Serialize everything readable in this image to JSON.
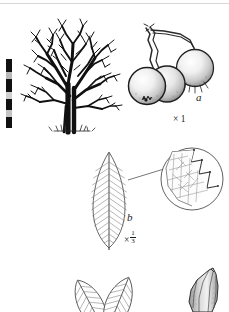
{
  "plate": {
    "kind": "botanical-illustration-plate",
    "background_color": "#ffffff",
    "ink_color": "#1a1a1a",
    "width": 229,
    "height": 312
  },
  "labels": {
    "fruit_letter": "a",
    "fruit_magnification": "× 1",
    "leaf_letter": "b",
    "leaf_magnification_prefix": "×",
    "leaf_magnification_numerator": "1",
    "leaf_magnification_denominator": "3"
  },
  "figures": {
    "habit": {
      "name": "tree-habit",
      "description": "Bare deciduous tree in winter silhouette with broad spreading crown and short double trunk",
      "ink_color": "#101010"
    },
    "fruit": {
      "name": "fruit-cluster",
      "description": "Three globose stippled fruits on slender stalks with persistent calyx lobes at apex",
      "count": 3,
      "ink_color": "#1a1a1a"
    },
    "leaf": {
      "name": "leaf-blade",
      "description": "Narrow elliptic to lanceolate leaf with pinnate venation and serrate margin",
      "vein_pairs": 16,
      "ink_color": "#5a5a5a"
    },
    "margin_detail": {
      "name": "leaf-margin-detail",
      "description": "Circular magnified inset of serrate leaf margin showing reticulate venation",
      "ink_color": "#6a6a6a"
    },
    "leaf_pair": {
      "name": "leaf-pair-cropped",
      "description": "Two small leaves cropped by the lower edge of the plate",
      "ink_color": "#4a4a4a"
    },
    "bud": {
      "name": "bud-cropped",
      "description": "Shaded elongate pointed bud cropped by the lower right edge of the plate",
      "ink_color": "#3a3a3a"
    }
  },
  "scale_bar": {
    "name": "height-scale-bar",
    "segments": [
      "#111111",
      "#b8b8b8",
      "#111111",
      "#cfcfcf",
      "#111111",
      "#c4c4c4",
      "#111111"
    ],
    "segment_heights": [
      13,
      7,
      13,
      7,
      11,
      7,
      11
    ]
  }
}
